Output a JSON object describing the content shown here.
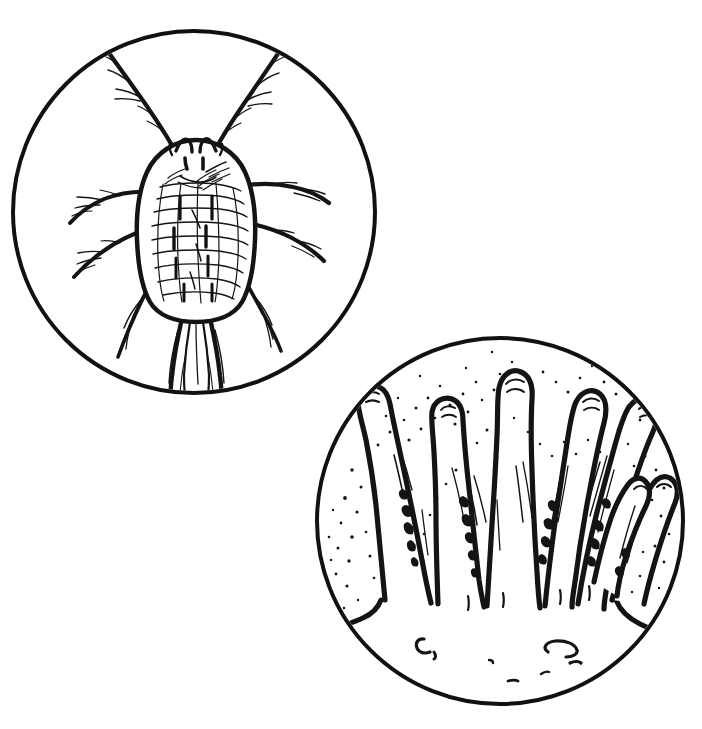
{
  "figure": {
    "kind": "scientific-line-illustration",
    "background_color": "#ffffff",
    "ink_color": "#111111",
    "width": 702,
    "height": 729,
    "caption": "",
    "panels": [
      {
        "id": "panel-mite",
        "label": "",
        "subject": "mite",
        "subject_description": "Dorsal view line drawing of an eriophyoid/tetranychid-type mite with eight legs, paired dark eyespots, and a reticulated, segmented idiosoma",
        "circle": {
          "cx": 194,
          "cy": 212,
          "r": 181,
          "stroke_width": 4
        },
        "features": {
          "body_outline": "oval idiosoma",
          "eyespots": 2,
          "legs": 8,
          "dorsal_striations": "reticulated grid of transverse and longitudinal lines",
          "setae": "fine bristles along legs and body margin"
        }
      },
      {
        "id": "panel-trichomes",
        "label": "",
        "subject": "glandular trichomes",
        "subject_description": "Finger-like plant trichomes (leaf hairs) rising from an epidermal surface, with stippled exudate granules and small stomatal marks on the epidermis",
        "circle": {
          "cx": 500,
          "cy": 521,
          "r": 183,
          "stroke_width": 4
        },
        "features": {
          "trichome_count": 7,
          "tips": "rounded, club-shaped",
          "stipple": "fine granular dots between hairs",
          "epidermis_marks": "small C-shaped stomata"
        }
      }
    ],
    "ghost_artifact": {
      "visible": false,
      "note": "faint scanner bleed-through along the lower-left margin",
      "text": "faint bleed-through text"
    }
  }
}
